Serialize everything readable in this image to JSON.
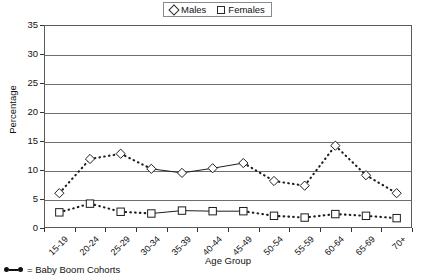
{
  "chart_data": {
    "type": "line",
    "title": "",
    "xlabel": "Age Group",
    "ylabel": "Percentage",
    "ylim": [
      0,
      35
    ],
    "ytick_step": 5,
    "yticks": [
      0,
      5,
      10,
      15,
      20,
      25,
      30,
      35
    ],
    "grid": true,
    "legend_position": "top-center",
    "categories": [
      "15-19",
      "20-24",
      "25-29",
      "30-34",
      "35-39",
      "40-44",
      "45-49",
      "50-54",
      "55-59",
      "60-64",
      "65-69",
      "70+"
    ],
    "series": [
      {
        "name": "Males",
        "marker": "open-diamond",
        "values": [
          6.0,
          11.9,
          12.8,
          10.2,
          9.5,
          10.3,
          11.2,
          8.1,
          7.3,
          14.2,
          9.1,
          6.0
        ]
      },
      {
        "name": "Females",
        "marker": "open-square",
        "values": [
          2.7,
          4.2,
          2.8,
          2.5,
          3.0,
          2.9,
          2.9,
          2.1,
          1.8,
          2.4,
          2.1,
          1.7
        ]
      }
    ],
    "annotations": {
      "baby_boom_segment": {
        "note": "Solid line segments denote Baby Boom Cohorts",
        "categories": [
          "30-34",
          "35-39",
          "40-44",
          "45-49"
        ],
        "start_index": 3,
        "end_index": 6
      }
    }
  },
  "legend": {
    "entries": [
      {
        "label": "Males",
        "glyph": "diamond-outline-icon"
      },
      {
        "label": "Females",
        "glyph": "square-outline-icon"
      }
    ]
  },
  "axes": {
    "y_title": "Percentage",
    "x_title": "Age Group",
    "y_tick_labels": [
      "35",
      "30",
      "25",
      "20",
      "15",
      "10",
      "5",
      "0"
    ],
    "x_tick_labels": [
      "15-19",
      "20-24",
      "25-29",
      "30-34",
      "35-39",
      "40-44",
      "45-49",
      "50-54",
      "55-59",
      "60-64",
      "65-69",
      "70+"
    ]
  },
  "footnote": {
    "text": "= Baby Boom Cohorts",
    "glyph": "dot-line-dot-icon"
  },
  "colors": {
    "series_stroke": "#1d1d1d",
    "axis": "#5a5a5a",
    "gridline": "#6e6e6e",
    "background": "#ffffff",
    "text": "#111111"
  }
}
